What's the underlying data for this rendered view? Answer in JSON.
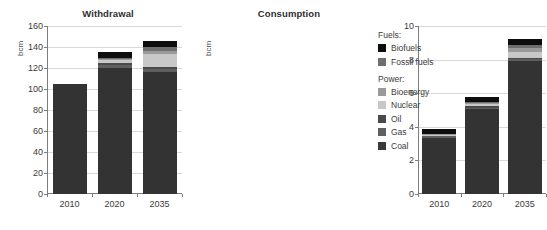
{
  "chart_data": [
    {
      "type": "bar",
      "title": "Withdrawal",
      "xlabel": "",
      "ylabel": "bcm",
      "categories": [
        "2010",
        "2020",
        "2035"
      ],
      "ylim": [
        0,
        160
      ],
      "yticks": [
        0,
        20,
        40,
        60,
        80,
        100,
        120,
        140,
        160
      ],
      "grid": true,
      "stacked": true,
      "series": [
        {
          "name": "Coal",
          "values": [
            105,
            120,
            116
          ]
        },
        {
          "name": "Gas",
          "values": [
            0,
            2.5,
            3
          ]
        },
        {
          "name": "Oil",
          "values": [
            0,
            2,
            2
          ]
        },
        {
          "name": "Nuclear",
          "values": [
            0,
            3,
            12
          ]
        },
        {
          "name": "Bioenergy",
          "values": [
            0,
            1.5,
            3
          ]
        },
        {
          "name": "Fossil fuels",
          "values": [
            0,
            1,
            4
          ]
        },
        {
          "name": "Biofuels",
          "values": [
            0,
            5,
            6
          ]
        }
      ],
      "totals": [
        105,
        135,
        146
      ]
    },
    {
      "type": "bar",
      "title": "Consumption",
      "xlabel": "",
      "ylabel": "bcm",
      "categories": [
        "2010",
        "2020",
        "2035"
      ],
      "ylim": [
        0,
        10
      ],
      "yticks": [
        0,
        2,
        4,
        6,
        8,
        10
      ],
      "grid": true,
      "stacked": true,
      "series": [
        {
          "name": "Coal",
          "values": [
            3.35,
            5.05,
            7.9
          ]
        },
        {
          "name": "Gas",
          "values": [
            0.08,
            0.1,
            0.12
          ]
        },
        {
          "name": "Oil",
          "values": [
            0.05,
            0.08,
            0.1
          ]
        },
        {
          "name": "Nuclear",
          "values": [
            0.05,
            0.1,
            0.35
          ]
        },
        {
          "name": "Bioenergy",
          "values": [
            0.04,
            0.07,
            0.22
          ]
        },
        {
          "name": "Fossil fuels",
          "values": [
            0.03,
            0.1,
            0.21
          ]
        },
        {
          "name": "Biofuels",
          "values": [
            0.3,
            0.3,
            0.3
          ]
        }
      ],
      "totals": [
        3.9,
        5.8,
        9.2
      ]
    }
  ],
  "legend": {
    "groups": [
      {
        "title": "Fuels:",
        "items": [
          {
            "label": "Biofuels",
            "color": "#0d0d0d"
          },
          {
            "label": "Fossil fuels",
            "color": "#6e6e6e"
          }
        ]
      },
      {
        "title": "Power:",
        "items": [
          {
            "label": "Bioenergy",
            "color": "#9a9a9a"
          },
          {
            "label": "Nuclear",
            "color": "#c8c8c8"
          },
          {
            "label": "Oil",
            "color": "#4a4a4a"
          },
          {
            "label": "Gas",
            "color": "#5f5f5f"
          },
          {
            "label": "Coal",
            "color": "#3a3a3a"
          }
        ]
      }
    ]
  },
  "colors": {
    "Biofuels": "#0d0d0d",
    "Fossil fuels": "#6e6e6e",
    "Bioenergy": "#9a9a9a",
    "Nuclear": "#c8c8c8",
    "Oil": "#4a4a4a",
    "Gas": "#5f5f5f",
    "Coal": "#333333",
    "grid": "#d9d9d9",
    "axis": "#7d7d7d",
    "text": "#3b3b3b"
  }
}
